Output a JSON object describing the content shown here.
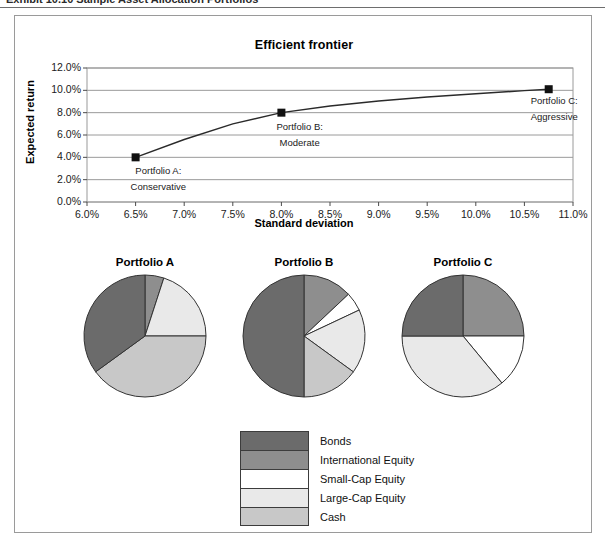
{
  "caption": {
    "text": "Exhibit 10.10 Sample Asset Allocation Portfolios"
  },
  "figure": {
    "title": "Efficient frontier"
  },
  "colors": {
    "bonds": "#6b6b6b",
    "international_equity": "#8e8e8e",
    "small_cap_equity": "#ffffff",
    "large_cap_equity": "#e9e9e9",
    "cash": "#c8c8c8",
    "line": "#2a2a2a",
    "marker": "#111111",
    "grid": "#9a9a9a",
    "frame": "#9a9a9a"
  },
  "chart_data": [
    {
      "type": "line",
      "title": "Efficient frontier",
      "xlabel": "Standard deviation",
      "ylabel": "Expected return",
      "xlim": [
        6.0,
        11.0
      ],
      "ylim": [
        0.0,
        12.0
      ],
      "grid": true,
      "legend": "none",
      "xticks": [
        "6.0%",
        "6.5%",
        "7.0%",
        "7.5%",
        "8.0%",
        "8.5%",
        "9.0%",
        "9.5%",
        "10.0%",
        "10.5%",
        "11.0%"
      ],
      "yticks": [
        "0.0%",
        "2.0%",
        "4.0%",
        "6.0%",
        "8.0%",
        "10.0%",
        "12.0%"
      ],
      "x": [
        6.5,
        7.0,
        7.5,
        8.0,
        8.5,
        9.0,
        9.5,
        10.0,
        10.5,
        10.75
      ],
      "y": [
        4.0,
        5.6,
        7.0,
        8.0,
        8.6,
        9.05,
        9.4,
        9.7,
        9.97,
        10.1
      ],
      "points": [
        {
          "name": "Portfolio A",
          "x": 6.5,
          "y": 4.0,
          "label_line1": "Portfolio A:",
          "label_line2": "Conservative"
        },
        {
          "name": "Portfolio B",
          "x": 8.0,
          "y": 8.0,
          "label_line1": "Portfolio B:",
          "label_line2": "Moderate"
        },
        {
          "name": "Portfolio C",
          "x": 10.75,
          "y": 10.1,
          "label_line1": "Portfolio C:",
          "label_line2": "Aggressive"
        }
      ]
    },
    {
      "type": "pie",
      "title": "Portfolio A",
      "labels": [
        "International Equity",
        "Large-Cap Equity",
        "Cash",
        "Bonds"
      ],
      "values": [
        5,
        20,
        40,
        35
      ]
    },
    {
      "type": "pie",
      "title": "Portfolio B",
      "labels": [
        "International Equity",
        "Small-Cap Equity",
        "Large-Cap Equity",
        "Cash",
        "Bonds"
      ],
      "values": [
        13,
        5,
        17,
        15,
        50
      ]
    },
    {
      "type": "pie",
      "title": "Portfolio C",
      "labels": [
        "International Equity",
        "Small-Cap Equity",
        "Large-Cap Equity",
        "Bonds"
      ],
      "values": [
        25,
        14,
        36,
        25
      ]
    }
  ],
  "legend": {
    "items": [
      {
        "label": "Bonds",
        "color": "#6b6b6b"
      },
      {
        "label": "International Equity",
        "color": "#8e8e8e"
      },
      {
        "label": "Small-Cap Equity",
        "color": "#ffffff"
      },
      {
        "label": "Large-Cap Equity",
        "color": "#e9e9e9"
      },
      {
        "label": "Cash",
        "color": "#c8c8c8"
      }
    ]
  }
}
